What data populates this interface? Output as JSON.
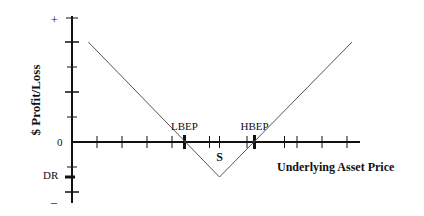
{
  "chart_data": {
    "type": "line",
    "title": "",
    "xlabel": "Underlying Asset Price",
    "ylabel": "$ Profit/Loss",
    "ylim": [
      -1.4,
      4.2
    ],
    "xlim": [
      0,
      11
    ],
    "y_tick_labels": {
      "top": "+",
      "zero": "0",
      "bottom": "–",
      "debit": "DR"
    },
    "y_ticks_major": [
      4,
      2,
      -2
    ],
    "y_ticks_minor": [
      3,
      1,
      -1
    ],
    "debit_level": -1.4,
    "x_ticks": [
      1,
      2,
      3,
      4,
      5.5,
      7,
      8.5,
      9,
      10,
      11
    ],
    "annotations": [
      {
        "label": "LBEP",
        "x": 4.5,
        "marker": "bold-tick"
      },
      {
        "label": "S",
        "x": 5.9,
        "marker": "tick"
      },
      {
        "label": "HBEP",
        "x": 7.3,
        "marker": "bold-tick"
      }
    ],
    "series": [
      {
        "name": "Long Straddle Payoff",
        "x": [
          0.65,
          5.9,
          11.2
        ],
        "y": [
          4,
          -1.4,
          4
        ]
      }
    ],
    "grid": false,
    "legend": "none"
  }
}
